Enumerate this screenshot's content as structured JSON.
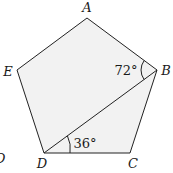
{
  "diagram": {
    "shape": "regular pentagon",
    "fill_color": "#f2f2f2",
    "stroke_color": "#222222",
    "vertices": [
      {
        "name": "A",
        "x": 87,
        "y": 18,
        "label_x": 87,
        "label_y": 12
      },
      {
        "name": "B",
        "x": 157,
        "y": 70,
        "label_x": 166,
        "label_y": 74
      },
      {
        "name": "C",
        "x": 130,
        "y": 153,
        "label_x": 133,
        "label_y": 167
      },
      {
        "name": "D",
        "x": 44,
        "y": 153,
        "label_x": 42,
        "label_y": 167
      },
      {
        "name": "E",
        "x": 17,
        "y": 70,
        "label_x": 7,
        "label_y": 75
      }
    ],
    "diagonal": {
      "from": "D",
      "to": "B"
    },
    "angles": [
      {
        "label": "72°",
        "vertex": "B",
        "between": [
          "A",
          "D"
        ],
        "text_x": 126,
        "text_y": 75
      },
      {
        "label": "36°",
        "vertex": "D",
        "between": [
          "B",
          "C"
        ],
        "text_x": 84,
        "text_y": 147
      }
    ],
    "stray_glyph": {
      "text": "D",
      "note": "cropped letter at left edge",
      "x": -4,
      "y": 162
    }
  }
}
